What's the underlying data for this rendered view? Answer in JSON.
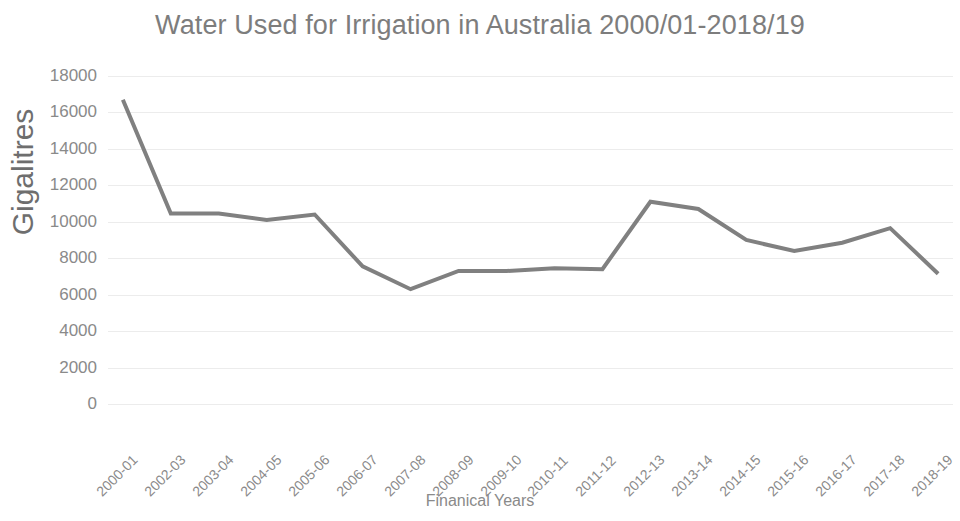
{
  "chart_data": {
    "type": "line",
    "title": "Water Used for Irrigation in Australia 2000/01-2018/19",
    "xlabel": "Finanical Years",
    "ylabel": "Gigalitres",
    "categories": [
      "2000-01",
      "2002-03",
      "2003-04",
      "2004-05",
      "2005-06",
      "2006-07",
      "2007-08",
      "2008-09",
      "2009-10",
      "2010-11",
      "2011-12",
      "2012-13",
      "2013-14",
      "2014-15",
      "2015-16",
      "2016-17",
      "2017-18",
      "2018-19"
    ],
    "values": [
      16700,
      10450,
      10450,
      10100,
      10400,
      7550,
      6300,
      7300,
      7300,
      7450,
      7400,
      11100,
      10700,
      9000,
      8400,
      8850,
      9650,
      7150
    ],
    "ylim": [
      0,
      18000
    ],
    "y_ticks": [
      18000,
      16000,
      14000,
      12000,
      10000,
      8000,
      6000,
      4000,
      2000,
      0
    ],
    "y_tick_labels": [
      "18000",
      "16000",
      "14000",
      "12000",
      "10000",
      "8000",
      "6000",
      "4000",
      "2000",
      "0"
    ],
    "grid": true,
    "legend": false,
    "series_color": "#808080",
    "grid_color": "#ececec",
    "text_color": "#8a8a8a",
    "title_color": "#7d7d7d",
    "line_width": 4
  }
}
